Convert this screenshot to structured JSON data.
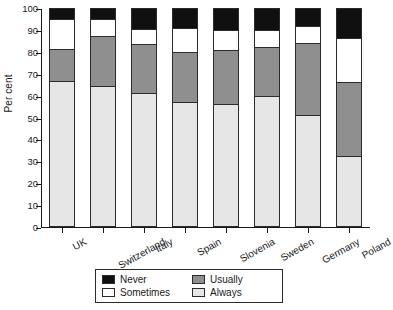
{
  "chart_data": {
    "type": "bar",
    "subtype": "stacked-bar-100",
    "title": "",
    "xlabel": "",
    "ylabel": "Per cent",
    "ylim": [
      0,
      100
    ],
    "ytick_interval": 10,
    "ytick_labels": [
      "0",
      "10",
      "20",
      "30",
      "40",
      "50",
      "60",
      "70",
      "80",
      "90",
      "100"
    ],
    "grid": false,
    "legend_position": "bottom-center",
    "stack_order_bottom_to_top": [
      "Always",
      "Usually",
      "Sometimes",
      "Never"
    ],
    "categories": [
      "UK",
      "Switzerland",
      "Italy",
      "Spain",
      "Slovenia",
      "Sweden",
      "Germany",
      "Poland"
    ],
    "series": [
      {
        "name": "Never",
        "color": "#101010",
        "values": [
          5.0,
          5.0,
          9.5,
          9.0,
          10.0,
          10.0,
          8.0,
          13.5
        ]
      },
      {
        "name": "Sometimes",
        "color": "#ffffff",
        "values": [
          13.5,
          8.0,
          7.0,
          11.0,
          9.0,
          8.0,
          8.0,
          20.5
        ]
      },
      {
        "name": "Usually",
        "color": "#8f8f8f",
        "values": [
          15.0,
          22.5,
          22.5,
          23.0,
          25.0,
          22.0,
          33.0,
          33.5
        ]
      },
      {
        "name": "Always",
        "color": "#e6e6e6",
        "values": [
          66.5,
          64.5,
          61.0,
          57.0,
          56.0,
          60.0,
          51.0,
          32.5
        ]
      }
    ]
  },
  "axis": {
    "y_title": "Per cent"
  },
  "legend": {
    "entries": [
      {
        "label": "Never",
        "swatch": "black-swatch"
      },
      {
        "label": "Usually",
        "swatch": "dark-grey-swatch"
      },
      {
        "label": "Sometimes",
        "swatch": "white-swatch"
      },
      {
        "label": "Always",
        "swatch": "light-grey-swatch"
      }
    ]
  }
}
